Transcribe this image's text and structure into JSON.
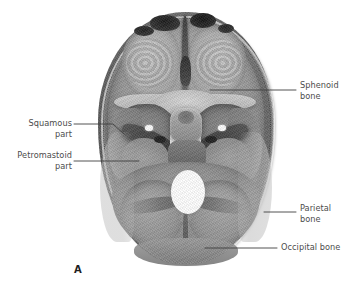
{
  "figure": {
    "letter": "A",
    "image_name": "cranial-base-internal-superior-view",
    "background_color": "#ffffff",
    "label_text_color": "#4c4c4c",
    "leader_line_color": "#3f3f3f"
  },
  "labels": [
    {
      "id": "sphenoid",
      "text": "Sphenoid\nbone",
      "side": "right",
      "leader": {
        "x1": 210,
        "y1": 90,
        "x2": 296,
        "y2": 90
      }
    },
    {
      "id": "squamous",
      "text": "Squamous\npart",
      "side": "left",
      "leader": {
        "x1": 74,
        "y1": 124,
        "x2": 113,
        "y2": 124,
        "x3": 124,
        "y3": 134
      }
    },
    {
      "id": "petromastoid",
      "text": "Petromastoid\npart",
      "side": "left",
      "leader": {
        "x1": 74,
        "y1": 161,
        "x2": 139,
        "y2": 161
      }
    },
    {
      "id": "parietal",
      "text": "Parietal\nbone",
      "side": "right",
      "leader": {
        "x1": 264,
        "y1": 212,
        "x2": 296,
        "y2": 212
      }
    },
    {
      "id": "occipital",
      "text": "Occipital bone",
      "side": "right",
      "leader": {
        "x1": 205,
        "y1": 248,
        "x2": 277,
        "y2": 248
      }
    }
  ],
  "anatomy_regions": [
    {
      "name": "anterior-cranial-fossa-left"
    },
    {
      "name": "anterior-cranial-fossa-right"
    },
    {
      "name": "crista-galli"
    },
    {
      "name": "sphenoid-body"
    },
    {
      "name": "lesser-wing-ridge-left"
    },
    {
      "name": "lesser-wing-ridge-right"
    },
    {
      "name": "middle-cranial-fossa-left"
    },
    {
      "name": "middle-cranial-fossa-right"
    },
    {
      "name": "petrous-ridge-left"
    },
    {
      "name": "petrous-ridge-right"
    },
    {
      "name": "sella-turcica"
    },
    {
      "name": "clivus"
    },
    {
      "name": "foramen-magnum"
    },
    {
      "name": "posterior-cranial-fossa"
    },
    {
      "name": "cerebellar-fossa-left"
    },
    {
      "name": "cerebellar-fossa-right"
    },
    {
      "name": "internal-occipital-crest"
    },
    {
      "name": "calvarial-rim"
    }
  ]
}
